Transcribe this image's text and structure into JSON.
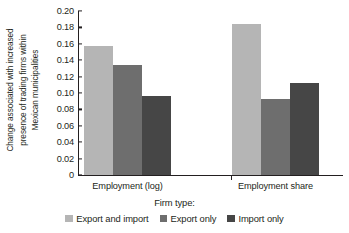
{
  "chart_data": {
    "type": "bar",
    "title": "",
    "subtitle": "",
    "xlabel": "Firm type:",
    "ylabel_lines": [
      "Change associated with increased",
      "presence of trading firms within",
      "Mexican municipalities"
    ],
    "ylabel": "Change associated with increased presence of trading firms within Mexican municipalities",
    "categories": [
      "Employment (log)",
      "Employment share"
    ],
    "series": [
      {
        "name": "Export and import",
        "color": "#b5b5b5",
        "values": [
          0.157,
          0.184
        ]
      },
      {
        "name": "Export only",
        "color": "#6e6e6e",
        "values": [
          0.134,
          0.093
        ]
      },
      {
        "name": "Import only",
        "color": "#464646",
        "values": [
          0.096,
          0.112
        ]
      }
    ],
    "ylim": [
      0,
      0.2
    ],
    "ytick_values": [
      0.2,
      0.18,
      0.16,
      0.14,
      0.12,
      0.1,
      0.08,
      0.06,
      0.04,
      0.02,
      0
    ],
    "ytick_labels": [
      "0.20",
      "0.18",
      "0.16",
      "0.14",
      "0.12",
      "0.10",
      "0.08",
      "0.06",
      "0.04",
      "0.02",
      "0"
    ],
    "grid": false,
    "legend_position": "bottom",
    "axis_color": "#231f20",
    "background": "#ffffff"
  }
}
